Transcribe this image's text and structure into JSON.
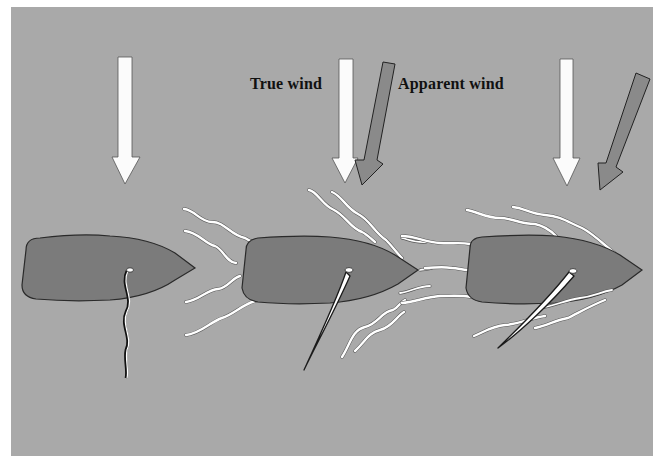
{
  "figure": {
    "labels": {
      "true_wind": "True wind",
      "apparent_wind": "Apparent wind"
    },
    "colors": {
      "page_background": "#ffffff",
      "panel_background": "#a9a9a9",
      "hull_fill": "#7b7b7b",
      "hull_outline": "#2a2a2a",
      "true_wind_arrow": "#fbfbfb",
      "apparent_wind_arrow": "#8a8a8a",
      "sail": "#ffffff",
      "streamline": "#ffffff"
    },
    "panels": [
      {
        "id": "boat-1",
        "state": "head to wind / luffing sail",
        "arrows": [
          "true-wind"
        ]
      },
      {
        "id": "boat-2",
        "state": "sailing, sail drawing",
        "arrows": [
          "true-wind",
          "apparent-wind"
        ]
      },
      {
        "id": "boat-3",
        "state": "sailing faster, apparent wind moved forward",
        "arrows": [
          "true-wind",
          "apparent-wind"
        ]
      }
    ]
  }
}
